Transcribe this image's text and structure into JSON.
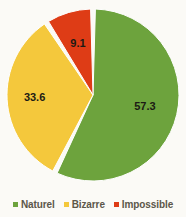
{
  "background_color": "#fbfaf6",
  "chart_data": {
    "type": "pie",
    "title": "",
    "categories": [
      "Naturel",
      "Bizarre",
      "Impossible"
    ],
    "values": [
      57.3,
      33.6,
      9.1
    ],
    "labels": [
      "57.3",
      "33.6",
      "9.1"
    ],
    "colors": [
      "#6da33d",
      "#f4c83c",
      "#de3c16"
    ],
    "label_text_color": "#1c1a14",
    "slice_gap_color": "#ffffff",
    "start_angle_deg": 0,
    "direction": "clockwise",
    "legend": {
      "position": "bottom",
      "entries": [
        {
          "label": "Naturel",
          "color": "#6da33d"
        },
        {
          "label": "Bizarre",
          "color": "#f4c83c"
        },
        {
          "label": "Impossible",
          "color": "#de3c16"
        }
      ],
      "text_color": "#5c574a"
    },
    "grid": false,
    "xlabel": "",
    "ylabel": ""
  }
}
